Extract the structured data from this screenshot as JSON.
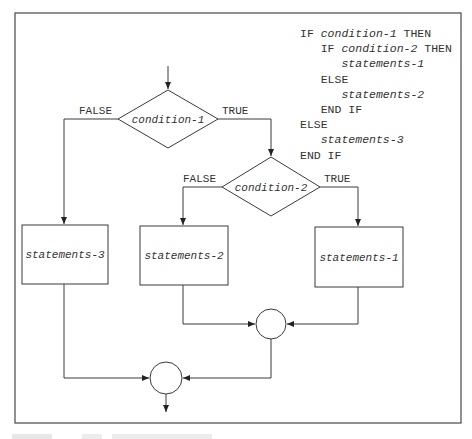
{
  "figure": {
    "code": {
      "lines": [
        {
          "indent": 0,
          "parts": [
            {
              "t": "IF ",
              "i": false
            },
            {
              "t": "condition-1",
              "i": true
            },
            {
              "t": " THEN",
              "i": false
            }
          ]
        },
        {
          "indent": 1,
          "parts": [
            {
              "t": "IF ",
              "i": false
            },
            {
              "t": "condition-2",
              "i": true
            },
            {
              "t": " THEN",
              "i": false
            }
          ]
        },
        {
          "indent": 2,
          "parts": [
            {
              "t": "statements-1",
              "i": true
            }
          ]
        },
        {
          "indent": 1,
          "parts": [
            {
              "t": "ELSE",
              "i": false
            }
          ]
        },
        {
          "indent": 2,
          "parts": [
            {
              "t": "statements-2",
              "i": true
            }
          ]
        },
        {
          "indent": 1,
          "parts": [
            {
              "t": "END IF",
              "i": false
            }
          ]
        },
        {
          "indent": 0,
          "parts": [
            {
              "t": "ELSE",
              "i": false
            }
          ]
        },
        {
          "indent": 1,
          "parts": [
            {
              "t": "statements-3",
              "i": true
            }
          ]
        },
        {
          "indent": 0,
          "parts": [
            {
              "t": "END IF",
              "i": false
            }
          ]
        }
      ]
    },
    "flowchart": {
      "decision_1": {
        "label": "condition-1",
        "false_label": "FALSE",
        "true_label": "TRUE"
      },
      "decision_2": {
        "label": "condition-2",
        "false_label": "FALSE",
        "true_label": "TRUE"
      },
      "process_1": {
        "label": "statements-1"
      },
      "process_2": {
        "label": "statements-2"
      },
      "process_3": {
        "label": "statements-3"
      }
    },
    "colors": {
      "stroke": "#3a3a3a",
      "border": "#555555",
      "text": "#333333"
    }
  }
}
